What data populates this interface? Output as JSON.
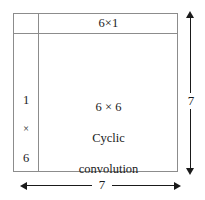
{
  "diagram": {
    "type": "block-diagram",
    "colors": {
      "box_border": "#8c8c8c",
      "arrow": "#1a1a1a",
      "text": "#1a1a1a",
      "background": "#ffffff"
    },
    "blocks": {
      "top_strip": {
        "label": "6×1"
      },
      "left_strip": {
        "lines": [
          "1",
          "×",
          "6"
        ]
      },
      "core": {
        "lines": [
          "6 × 6",
          "Cyclic",
          "convolution"
        ]
      }
    },
    "dimensions": {
      "vertical": {
        "label": "7",
        "orientation": "vertical",
        "arrow_style": "double-headed"
      },
      "horizontal": {
        "label": "7",
        "orientation": "horizontal",
        "arrow_style": "double-headed"
      }
    }
  }
}
